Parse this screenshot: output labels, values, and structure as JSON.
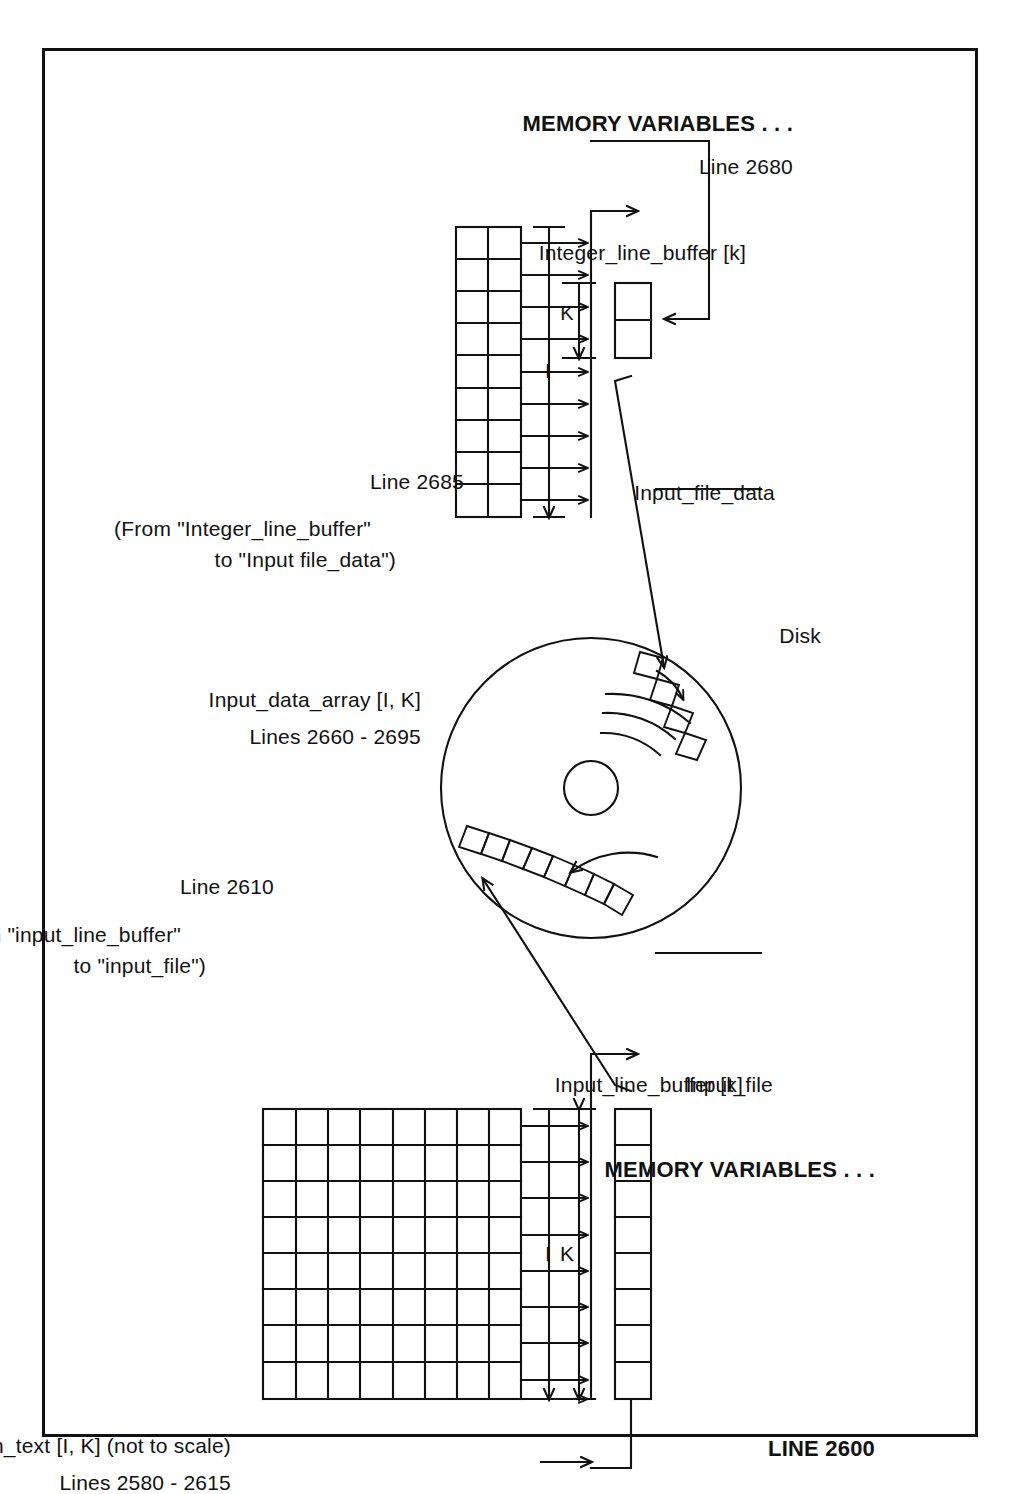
{
  "diagram": {
    "title_note": "(not to scale)",
    "left_section": {
      "line_label": "LINE 2600",
      "memory_heading": "MEMORY VARIABLES . . .",
      "file_label": "Input_file",
      "buffer_label": "Input_line_buffer [k]",
      "buffer_cells": 8,
      "dim_k": "K",
      "dim_i": "I",
      "array_label": "Screen_text [I, K]  (not to scale)",
      "array_lines": "Lines 2580 - 2615",
      "array_cols": 9,
      "array_rows": 8,
      "array_arrows": 9,
      "transfer_line": "Line 2610",
      "transfer_from": "(From \"input_line_buffer\"",
      "transfer_to": "to \"input_file\")"
    },
    "disk": {
      "label": "Disk"
    },
    "right_section": {
      "line_label": "Line 2680",
      "memory_heading": "MEMORY VARIABLES . . .",
      "file_label": "Input_file_data",
      "buffer_label": "Integer_line_buffer [k]",
      "buffer_cells": 2,
      "dim_k": "K",
      "dim_i": "I",
      "array_label": "Input_data_array [I, K]",
      "array_lines": "Lines 2660 - 2695",
      "array_cols": 9,
      "array_rows": 2,
      "array_arrows": 9,
      "transfer_line": "Line 2685",
      "transfer_from": "(From \"Integer_line_buffer\"",
      "transfer_to": "to \"Input file_data\")"
    },
    "colors": {
      "ink": "#111111",
      "paper": "#ffffff"
    }
  }
}
